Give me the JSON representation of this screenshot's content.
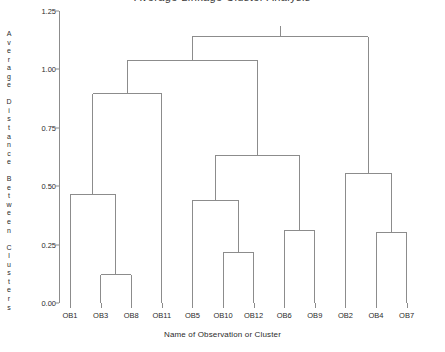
{
  "chart_data": {
    "type": "dendrogram",
    "title": "Average Linkage Cluster Analysis",
    "xlabel": "Name of Observation or Cluster",
    "ylabel": "Average Distance Between Clusters",
    "ylabel_chars": [
      "A",
      "v",
      "e",
      "r",
      "a",
      "g",
      "e",
      "",
      "D",
      "i",
      "s",
      "t",
      "a",
      "n",
      "c",
      "e",
      "",
      "B",
      "e",
      "t",
      "w",
      "e",
      "e",
      "n",
      "",
      "C",
      "l",
      "u",
      "s",
      "t",
      "e",
      "r",
      "s"
    ],
    "ylim": [
      0.0,
      1.25
    ],
    "yticks": [
      0.0,
      0.25,
      0.5,
      0.75,
      1.0,
      1.25
    ],
    "ytick_labels": [
      "0.00",
      "0.25",
      "0.50",
      "0.75",
      "1.00",
      "1.25"
    ],
    "grid": false,
    "legend": "none",
    "leaves": [
      "OB1",
      "OB3",
      "OB8",
      "OB11",
      "OB5",
      "OB10",
      "OB12",
      "OB6",
      "OB9",
      "OB2",
      "OB4",
      "OB7"
    ],
    "merges": [
      {
        "id": "m1",
        "left": "OB3",
        "right": "OB8",
        "height": 0.12
      },
      {
        "id": "m2",
        "left": "OB10",
        "right": "OB12",
        "height": 0.215
      },
      {
        "id": "m3",
        "left": "OB4",
        "right": "OB7",
        "height": 0.3
      },
      {
        "id": "m4",
        "left": "OB6",
        "right": "OB9",
        "height": 0.31
      },
      {
        "id": "m5",
        "left": "OB5",
        "right": "m2",
        "height": 0.44
      },
      {
        "id": "m6",
        "left": "OB1",
        "right": "m1",
        "height": 0.465
      },
      {
        "id": "m7",
        "left": "OB2",
        "right": "m3",
        "height": 0.555
      },
      {
        "id": "m8",
        "left": "m5",
        "right": "m4",
        "height": 0.63
      },
      {
        "id": "m9",
        "left": "m6",
        "right": "OB11",
        "height": 0.895
      },
      {
        "id": "m10",
        "left": "m9",
        "right": "m8",
        "height": 1.04
      },
      {
        "id": "m11",
        "left": "m10",
        "right": "m7",
        "height": 1.14
      }
    ]
  },
  "style": {
    "line_color": "#8c8c8c",
    "axis_color": "#8c8c8c",
    "text_color": "#2b2b2b",
    "background": "#ffffff"
  }
}
